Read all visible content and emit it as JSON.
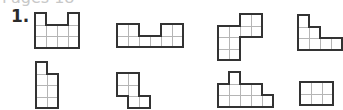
{
  "header": {
    "cropped_text": "Pages 18"
  },
  "question": {
    "label": "1."
  },
  "style": {
    "outline_color": "#333333",
    "grid_color": "#b5b5b5",
    "cell_w": 11,
    "cell_h": 11.5
  },
  "shapes": [
    {
      "name": "shape-1",
      "x": 35,
      "y": 13,
      "cells": [
        [
          0,
          0
        ],
        [
          0,
          3
        ],
        [
          1,
          0
        ],
        [
          1,
          1
        ],
        [
          1,
          2
        ],
        [
          1,
          3
        ],
        [
          2,
          0
        ],
        [
          2,
          1
        ],
        [
          2,
          2
        ],
        [
          2,
          3
        ]
      ]
    },
    {
      "name": "shape-2",
      "x": 117,
      "y": 24,
      "cells": [
        [
          0,
          0
        ],
        [
          0,
          1
        ],
        [
          0,
          4
        ],
        [
          0,
          5
        ],
        [
          1,
          0
        ],
        [
          1,
          1
        ],
        [
          1,
          2
        ],
        [
          1,
          3
        ],
        [
          1,
          4
        ],
        [
          1,
          5
        ]
      ]
    },
    {
      "name": "shape-3",
      "x": 218,
      "y": 14,
      "cells": [
        [
          0,
          2
        ],
        [
          0,
          3
        ],
        [
          1,
          0
        ],
        [
          1,
          1
        ],
        [
          1,
          2
        ],
        [
          1,
          3
        ],
        [
          2,
          0
        ],
        [
          2,
          1
        ],
        [
          3,
          0
        ],
        [
          3,
          1
        ]
      ]
    },
    {
      "name": "shape-4",
      "x": 298,
      "y": 15,
      "cells": [
        [
          0,
          0
        ],
        [
          1,
          0
        ],
        [
          1,
          1
        ],
        [
          2,
          0
        ],
        [
          2,
          1
        ],
        [
          2,
          2
        ],
        [
          2,
          3
        ]
      ]
    },
    {
      "name": "shape-5",
      "x": 36,
      "y": 62,
      "cells": [
        [
          0,
          0
        ],
        [
          1,
          0
        ],
        [
          1,
          1
        ],
        [
          2,
          0
        ],
        [
          2,
          1
        ],
        [
          3,
          0
        ],
        [
          3,
          1
        ]
      ]
    },
    {
      "name": "shape-6",
      "x": 117,
      "y": 73,
      "cells": [
        [
          0,
          0
        ],
        [
          0,
          1
        ],
        [
          1,
          0
        ],
        [
          1,
          1
        ],
        [
          2,
          1
        ],
        [
          2,
          2
        ]
      ]
    },
    {
      "name": "shape-7",
      "x": 218,
      "y": 72,
      "cells": [
        [
          0,
          1
        ],
        [
          1,
          0
        ],
        [
          1,
          1
        ],
        [
          1,
          2
        ],
        [
          1,
          3
        ],
        [
          2,
          0
        ],
        [
          2,
          1
        ],
        [
          2,
          2
        ],
        [
          2,
          3
        ],
        [
          2,
          4
        ]
      ]
    },
    {
      "name": "shape-8",
      "x": 300,
      "y": 82,
      "cells": [
        [
          0,
          0
        ],
        [
          0,
          1
        ],
        [
          0,
          2
        ],
        [
          1,
          0
        ],
        [
          1,
          1
        ],
        [
          1,
          2
        ]
      ]
    }
  ]
}
